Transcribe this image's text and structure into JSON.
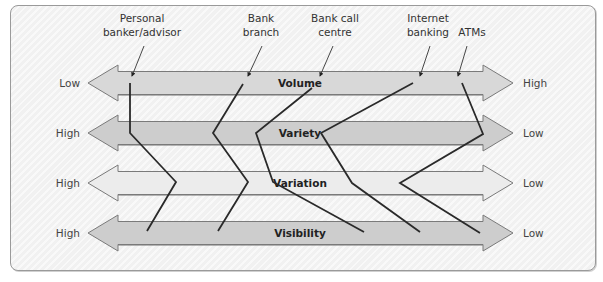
{
  "diagram": {
    "type": "four-Vs profile",
    "colors": {
      "panel_bg": "#f1f1f1",
      "panel_border": "#9a9a9a",
      "arrow_stroke": "#7a7a7a",
      "line_color": "#2a2a2a",
      "text_color": "#333333"
    },
    "dimensions": [
      {
        "name": "Volume",
        "left": "Low",
        "right": "High",
        "fill": "#d8d8d8",
        "y": 83
      },
      {
        "name": "Variety",
        "left": "High",
        "right": "Low",
        "fill": "#cdcdcd",
        "y": 133
      },
      {
        "name": "Variation",
        "left": "High",
        "right": "Low",
        "fill": "#ececec",
        "y": 183
      },
      {
        "name": "Visibility",
        "left": "High",
        "right": "Low",
        "fill": "#cdcdcd",
        "y": 233
      }
    ],
    "services": [
      {
        "line1": "Personal",
        "line2": "banker/advisor",
        "label_x": 142,
        "pointer": [
          [
            144,
            46
          ],
          [
            132,
            76
          ]
        ],
        "points": [
          [
            130,
            83
          ],
          [
            130,
            133
          ],
          [
            176,
            182
          ],
          [
            147,
            231
          ]
        ]
      },
      {
        "line1": "Bank",
        "line2": "branch",
        "label_x": 261,
        "pointer": [
          [
            262,
            46
          ],
          [
            248,
            76
          ]
        ],
        "points": [
          [
            243,
            84
          ],
          [
            213,
            133
          ],
          [
            248,
            182
          ],
          [
            218,
            231
          ]
        ]
      },
      {
        "line1": "Bank call",
        "line2": "centre",
        "label_x": 335,
        "pointer": [
          [
            333,
            46
          ],
          [
            320,
            76
          ]
        ],
        "points": [
          [
            312,
            88
          ],
          [
            256,
            133
          ],
          [
            273,
            182
          ],
          [
            364,
            232
          ]
        ]
      },
      {
        "line1": "Internet",
        "line2": "banking",
        "label_x": 428,
        "pointer": [
          [
            430,
            46
          ],
          [
            420,
            76
          ]
        ],
        "points": [
          [
            413,
            83
          ],
          [
            321,
            133
          ],
          [
            352,
            183
          ],
          [
            420,
            232
          ]
        ]
      },
      {
        "line1": "",
        "line2": "ATMs",
        "label_x": 472,
        "pointer": [
          [
            467,
            46
          ],
          [
            458,
            76
          ]
        ],
        "points": [
          [
            462,
            83
          ],
          [
            483,
            134
          ],
          [
            400,
            183
          ],
          [
            480,
            233
          ]
        ]
      }
    ]
  }
}
